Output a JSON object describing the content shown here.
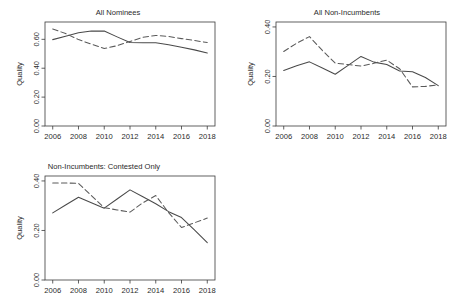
{
  "figure": {
    "panel_count": 3,
    "shared_ylabel": "Quality",
    "shared_xticks": [
      "2006",
      "2008",
      "2010",
      "2012",
      "2014",
      "2016",
      "2018"
    ],
    "line_color_solid": "#4a4a4a",
    "line_color_dashed": "#5a5a5a",
    "axis_color": "#3a3a3a",
    "background": "#ffffff"
  },
  "chart_data": [
    {
      "type": "line",
      "title": "All Nominees",
      "xlabel": "",
      "ylabel": "Quality",
      "x": [
        2006,
        2007,
        2008,
        2009,
        2010,
        2011,
        2012,
        2013,
        2014,
        2015,
        2016,
        2017,
        2018
      ],
      "xticks": [
        2006,
        2008,
        2010,
        2012,
        2014,
        2016,
        2018
      ],
      "yticks": [
        0.0,
        0.2,
        0.4,
        0.6
      ],
      "ytick_labels": [
        "0.00",
        "0.20",
        "0.40",
        "0.60"
      ],
      "xlim": [
        2005.4,
        2018.6
      ],
      "ylim": [
        0.0,
        0.72
      ],
      "grid": false,
      "legend": "none",
      "series": [
        {
          "name": "solid",
          "style": "solid",
          "values": [
            0.598,
            0.622,
            0.645,
            0.657,
            0.657,
            0.617,
            0.578,
            0.577,
            0.577,
            0.563,
            0.545,
            0.527,
            0.505
          ]
        },
        {
          "name": "dashed",
          "style": "dashed",
          "values": [
            0.672,
            0.64,
            0.598,
            0.567,
            0.536,
            0.556,
            0.585,
            0.615,
            0.627,
            0.62,
            0.605,
            0.592,
            0.578
          ]
        }
      ]
    },
    {
      "type": "line",
      "title": "All Non-Incumbents",
      "xlabel": "",
      "ylabel": "Quality",
      "x": [
        2006,
        2007,
        2008,
        2009,
        2010,
        2011,
        2012,
        2013,
        2014,
        2015,
        2016,
        2017,
        2018
      ],
      "xticks": [
        2006,
        2008,
        2010,
        2012,
        2014,
        2016,
        2018
      ],
      "yticks": [
        0.0,
        0.2,
        0.4
      ],
      "ytick_labels": [
        "0.00",
        "0.20",
        "0.40"
      ],
      "xlim": [
        2005.4,
        2018.6
      ],
      "ylim": [
        0.0,
        0.42
      ],
      "grid": false,
      "legend": "none",
      "series": [
        {
          "name": "solid",
          "style": "solid",
          "values": [
            0.224,
            0.243,
            0.259,
            0.234,
            0.209,
            0.245,
            0.281,
            0.258,
            0.248,
            0.222,
            0.219,
            0.196,
            0.163
          ]
        },
        {
          "name": "dashed",
          "style": "dashed",
          "values": [
            0.301,
            0.334,
            0.361,
            0.305,
            0.254,
            0.248,
            0.242,
            0.253,
            0.266,
            0.231,
            0.158,
            0.16,
            0.166
          ]
        }
      ]
    },
    {
      "type": "line",
      "title": "Non-Incumbents: Contested Only",
      "xlabel": "",
      "ylabel": "Quality",
      "x": [
        2006,
        2007,
        2008,
        2009,
        2010,
        2011,
        2012,
        2013,
        2014,
        2015,
        2016,
        2017,
        2018
      ],
      "xticks": [
        2006,
        2008,
        2010,
        2012,
        2014,
        2016,
        2018
      ],
      "yticks": [
        0.0,
        0.2,
        0.4
      ],
      "ytick_labels": [
        "0.00",
        "0.20",
        "0.40"
      ],
      "xlim": [
        2005.4,
        2018.6
      ],
      "ylim": [
        0.0,
        0.42
      ],
      "grid": false,
      "legend": "none",
      "series": [
        {
          "name": "solid",
          "style": "solid",
          "values": [
            0.271,
            0.303,
            0.334,
            0.312,
            0.29,
            0.327,
            0.364,
            0.336,
            0.308,
            0.276,
            0.252,
            0.202,
            0.151
          ]
        },
        {
          "name": "dashed",
          "style": "dashed",
          "values": [
            0.392,
            0.392,
            0.39,
            0.341,
            0.292,
            0.283,
            0.274,
            0.312,
            0.341,
            0.272,
            0.212,
            0.231,
            0.25
          ]
        }
      ]
    }
  ]
}
